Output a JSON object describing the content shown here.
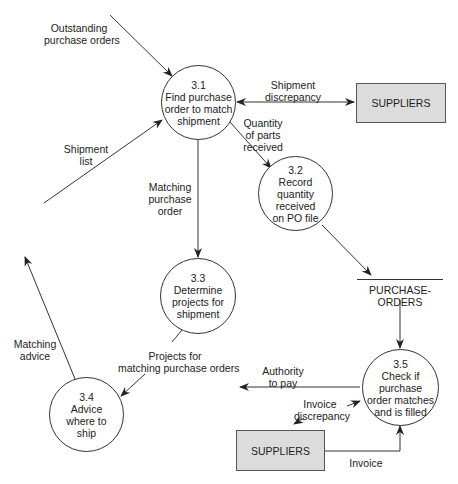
{
  "processes": [
    {
      "id": "3.1",
      "lines": [
        "3.1",
        "Find purchase",
        "order to match",
        "shipment"
      ]
    },
    {
      "id": "3.2",
      "lines": [
        "3.2",
        "Record",
        "quantity",
        "received",
        "on PO file"
      ]
    },
    {
      "id": "3.3",
      "lines": [
        "3.3",
        "Determine",
        "projects for",
        "shipment"
      ]
    },
    {
      "id": "3.4",
      "lines": [
        "3.4",
        "Advice",
        "where to",
        "ship"
      ]
    },
    {
      "id": "3.5",
      "lines": [
        "3.5",
        "Check if",
        "purchase",
        "order matches",
        "and is filled"
      ]
    }
  ],
  "external_entities": {
    "suppliers_top": "SUPPLIERS",
    "suppliers_bottom": "SUPPLIERS"
  },
  "data_store": {
    "purchase_orders": "PURCHASE-ORDERS"
  },
  "flows": {
    "outstanding_po": [
      "Outstanding",
      "purchase orders"
    ],
    "shipment_list": [
      "Shipment",
      "list"
    ],
    "shipment_discrepancy": [
      "Shipment",
      "discrepancy"
    ],
    "quantity_parts": [
      "Quantity",
      "of parts",
      "received"
    ],
    "matching_po": [
      "Matching",
      "purchase",
      "order"
    ],
    "matching_advice": [
      "Matching",
      "advice"
    ],
    "projects_for_matching": [
      "Projects for",
      "matching purchase orders"
    ],
    "authority_to_pay": [
      "Authority",
      "to pay"
    ],
    "invoice_discrepancy": [
      "Invoice",
      "discrepancy"
    ],
    "invoice": "Invoice"
  },
  "colors": {
    "line": "#333333",
    "entity_fill": "#dcdcdc"
  }
}
